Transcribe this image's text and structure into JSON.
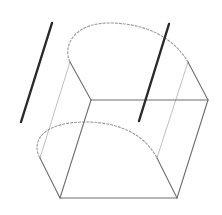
{
  "diagram": {
    "colors": {
      "background": "#ffffff",
      "thick_line": "#2a2a2a",
      "cube_edge": "#6e6e6e",
      "hidden_edge": "#b8b8b8",
      "arc": "#9a9a9a"
    },
    "thick_lines": [
      {
        "x1": 52,
        "y1": 23,
        "x2": 21,
        "y2": 122
      },
      {
        "x1": 169,
        "y1": 24,
        "x2": 139,
        "y2": 121
      }
    ],
    "cube_edges": [
      {
        "x1": 91,
        "y1": 100,
        "x2": 208,
        "y2": 100
      },
      {
        "x1": 91,
        "y1": 100,
        "x2": 60,
        "y2": 198
      },
      {
        "x1": 208,
        "y1": 100,
        "x2": 177,
        "y2": 198
      },
      {
        "x1": 60,
        "y1": 198,
        "x2": 177,
        "y2": 198
      },
      {
        "x1": 91,
        "y1": 100,
        "x2": 70,
        "y2": 62
      },
      {
        "x1": 208,
        "y1": 100,
        "x2": 188,
        "y2": 62
      },
      {
        "x1": 60,
        "y1": 198,
        "x2": 40,
        "y2": 158
      },
      {
        "x1": 177,
        "y1": 198,
        "x2": 157,
        "y2": 158
      }
    ],
    "hidden_edges": [
      {
        "x1": 70,
        "y1": 62,
        "x2": 40,
        "y2": 158
      },
      {
        "x1": 188,
        "y1": 62,
        "x2": 157,
        "y2": 158
      }
    ],
    "arcs": [
      {
        "d": "M 70 62 C 62 45, 75 22, 112 23 C 150 24, 175 40, 188 62"
      },
      {
        "d": "M 40 158 C 30 140, 45 122, 85 122 C 120 122, 145 135, 157 158"
      }
    ]
  }
}
